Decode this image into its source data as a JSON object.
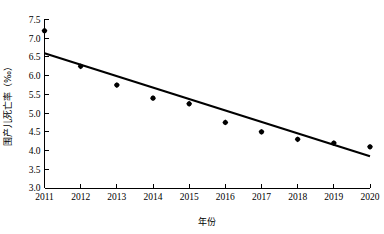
{
  "chart_data": {
    "type": "scatter",
    "title": "",
    "xlabel": "年份",
    "ylabel": "围产儿死亡率（‰）",
    "categories": [
      "2011",
      "2012",
      "2013",
      "2014",
      "2015",
      "2016",
      "2017",
      "2018",
      "2019",
      "2020"
    ],
    "x": [
      2011,
      2012,
      2013,
      2014,
      2015,
      2016,
      2017,
      2018,
      2019,
      2020
    ],
    "values": [
      7.2,
      6.25,
      5.75,
      5.4,
      5.25,
      4.75,
      4.5,
      4.3,
      4.2,
      4.1
    ],
    "series": [
      {
        "name": "围产儿死亡率",
        "type": "scatter",
        "values": [
          7.2,
          6.25,
          5.75,
          5.4,
          5.25,
          4.75,
          4.5,
          4.3,
          4.2,
          4.1
        ]
      },
      {
        "name": "趋势线",
        "type": "line",
        "endpoints": [
          {
            "x": 2011,
            "y": 6.6
          },
          {
            "x": 2020,
            "y": 3.85
          }
        ]
      }
    ],
    "xlim": [
      2011,
      2020
    ],
    "ylim": [
      3.0,
      7.5
    ],
    "ytick_labels": [
      "3.0",
      "3.5",
      "4.0",
      "4.5",
      "5.0",
      "5.5",
      "6.0",
      "6.5",
      "7.0",
      "7.5"
    ],
    "ytick_values": [
      3.0,
      3.5,
      4.0,
      4.5,
      5.0,
      5.5,
      6.0,
      6.5,
      7.0,
      7.5
    ],
    "xtick_labels": [
      "2011",
      "2012",
      "2013",
      "2014",
      "2015",
      "2016",
      "2017",
      "2018",
      "2019",
      "2020"
    ],
    "grid": false,
    "legend": "none",
    "marker_color": "#000000",
    "line_color": "#000000",
    "background_color": "#ffffff"
  }
}
